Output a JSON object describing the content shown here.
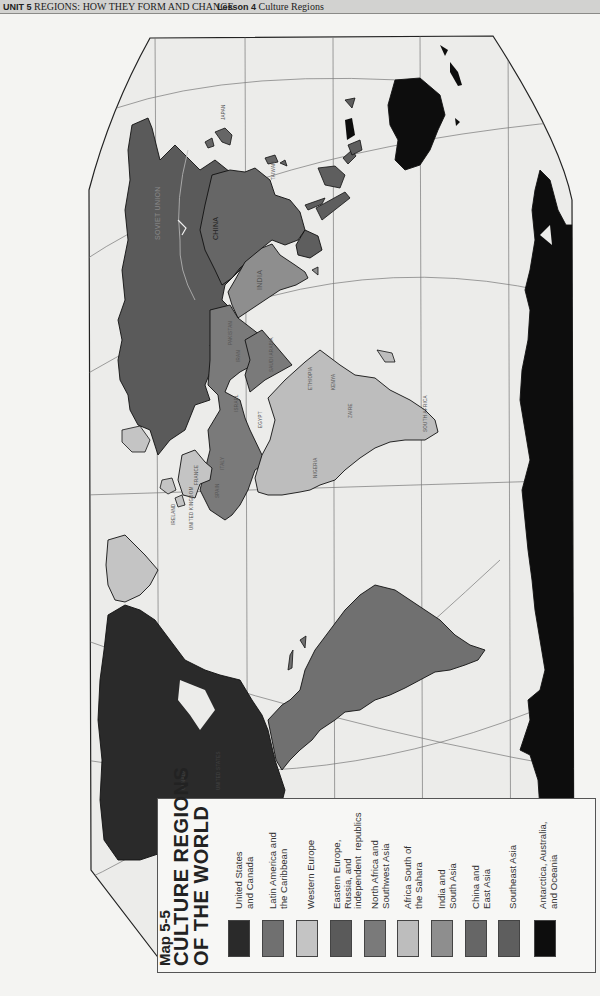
{
  "header": {
    "unit_number": "UNIT 5",
    "unit_title": "REGIONS: HOW THEY FORM AND CHANGE",
    "lesson_number": "Lesson 4",
    "lesson_title": "Culture Regions"
  },
  "map": {
    "orientation": "rotated 90° counter-clockwise",
    "labels": {
      "soviet_union": "SOVIET UNION",
      "china": "CHINA",
      "india": "INDIA",
      "japan": "JAPAN",
      "taiwan": "TAIWAN",
      "pakistan": "PAKISTAN",
      "iran": "IRAN",
      "saudi_arabia": "SAUDI ARABIA",
      "israel": "ISRAEL",
      "egypt": "EGYPT",
      "ethiopia": "ETHIOPIA",
      "kenya": "KENYA",
      "zaire": "ZAIRE",
      "nigeria": "NIGERIA",
      "south_africa": "SOUTH AFRICA",
      "italy": "ITALY",
      "france": "FRANCE",
      "spain": "SPAIN",
      "ireland": "IRELAND",
      "united_kingdom": "UNITED KINGDOM",
      "canada": "CANADA",
      "united_states": "UNITED STATES"
    }
  },
  "legend": {
    "map_number": "Map 5-5",
    "title_line1": "CULTURE REGIONS",
    "title_line2": "OF THE WORLD",
    "items": [
      {
        "label": "United States\nand Canada",
        "color": "#2a2a2a"
      },
      {
        "label": "Latin America and\nthe Caribbean",
        "color": "#707070"
      },
      {
        "label": "Western Europe",
        "color": "#c4c4c4"
      },
      {
        "label": "Eastern Europe,\nRussia, and\nindependent  republics",
        "color": "#5a5a5a"
      },
      {
        "label": "North Africa and\nSouthwest Asia",
        "color": "#7a7a7a"
      },
      {
        "label": "Africa South of\nthe Sahara",
        "color": "#bdbdbd"
      },
      {
        "label": "India and\nSouth Asia",
        "color": "#8e8e8e"
      },
      {
        "label": "China and\nEast Asia",
        "color": "#666666"
      },
      {
        "label": "Southeast Asia",
        "color": "#5e5e5e"
      },
      {
        "label": "Antarctica, Australia,\nand Oceania",
        "color": "#0d0d0d"
      }
    ]
  },
  "colors": {
    "ocean": "#ececea",
    "page": "#f4f4f2",
    "grid": "#777777",
    "outline": "#111111"
  }
}
